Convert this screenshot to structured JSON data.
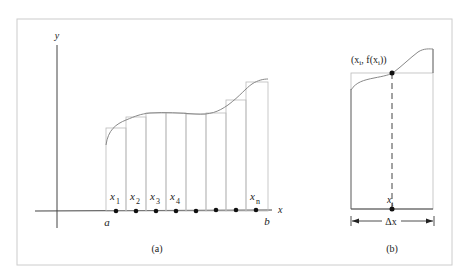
{
  "figure": {
    "panel_a": {
      "caption": "(a)",
      "y_axis_label": "y",
      "x_axis_label": "x",
      "left_endpoint": "a",
      "right_endpoint": "b",
      "sample_labels": [
        {
          "base": "x",
          "sub": "1"
        },
        {
          "base": "x",
          "sub": "2"
        },
        {
          "base": "x",
          "sub": "3"
        },
        {
          "base": "x",
          "sub": "4"
        },
        {
          "base": "x",
          "sub": "n"
        }
      ],
      "num_rectangles": 8
    },
    "panel_b": {
      "caption": "(b)",
      "point_label": "(x",
      "point_sub": "i",
      "point_mid": ", f(x",
      "point_end": "))",
      "sample_base": "x",
      "sample_sub": "i",
      "width_label": "Δx"
    },
    "colors": {
      "axis": "#444444",
      "rect": "#bbbbbb",
      "curve": "#888888",
      "dot": "#111111",
      "border": "#cccccc"
    }
  }
}
